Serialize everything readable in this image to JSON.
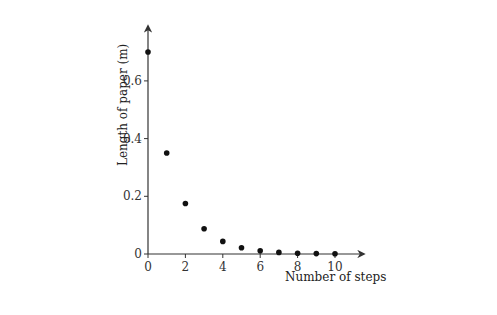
{
  "chart_data": {
    "type": "scatter",
    "title": "",
    "xlabel": "Number of steps",
    "ylabel": "Length of paper (m)",
    "x_ticks": [
      "0",
      "2",
      "4",
      "6",
      "8",
      "10"
    ],
    "y_ticks": [
      "0",
      "0.2",
      "0.4",
      "0.6"
    ],
    "xlim": [
      0,
      11.5
    ],
    "ylim": [
      0,
      0.8
    ],
    "grid": false,
    "legend": null,
    "x": [
      0,
      1,
      2,
      3,
      4,
      5,
      6,
      7,
      8,
      9,
      10
    ],
    "values": [
      0.7,
      0.35,
      0.175,
      0.0875,
      0.04375,
      0.021875,
      0.0109,
      0.0055,
      0.0027,
      0.0014,
      0.0007
    ]
  },
  "colors": {
    "axis": "#333333",
    "point": "#111111"
  }
}
